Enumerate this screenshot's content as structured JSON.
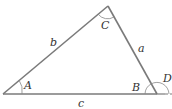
{
  "diagram": {
    "type": "triangle",
    "vertices": {
      "A": {
        "x": 3,
        "y": 94
      },
      "C": {
        "x": 108,
        "y": 6
      },
      "B": {
        "x": 157,
        "y": 94
      }
    },
    "sides": {
      "a": {
        "label": "a",
        "from": "B",
        "to": "C"
      },
      "b": {
        "label": "b",
        "from": "A",
        "to": "C"
      },
      "c": {
        "label": "c",
        "from": "A",
        "to": "B"
      }
    },
    "angles": {
      "A": {
        "label": "A"
      },
      "B": {
        "label": "B"
      },
      "C": {
        "label": "C"
      },
      "D": {
        "label": "D",
        "note": "exterior angle at B"
      }
    },
    "colors": {
      "stroke": "#7a7a7a",
      "text": "#333333"
    }
  }
}
